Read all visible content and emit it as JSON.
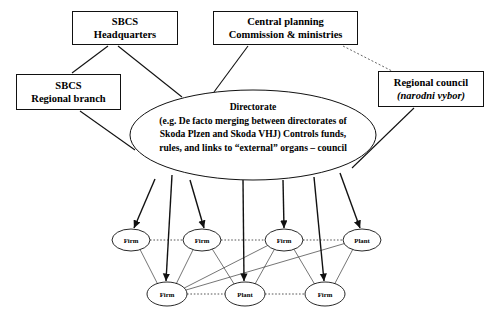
{
  "diagram": {
    "background_color": "#ffffff",
    "line_color": "#111111",
    "boxes": [
      {
        "id": "sbcs-headquarters",
        "lines": [
          "SBCS",
          "Headquarters"
        ],
        "x": 72,
        "y": 11,
        "w": 106,
        "h": 34
      },
      {
        "id": "central-planning",
        "lines": [
          "Central planning",
          "Commission & ministries"
        ],
        "x": 213,
        "y": 11,
        "w": 145,
        "h": 34
      },
      {
        "id": "sbcs-regional-branch",
        "lines": [
          "SBCS",
          "Regional branch"
        ],
        "x": 16,
        "y": 74,
        "w": 105,
        "h": 36
      },
      {
        "id": "regional-council",
        "lines": [
          "Regional council",
          "(narodni vybor)"
        ],
        "italic_lines": [
          1
        ],
        "x": 378,
        "y": 71,
        "w": 106,
        "h": 36
      }
    ],
    "directorate": {
      "id": "directorate",
      "title": "Directorate",
      "lines": [
        "(e.g. De facto merging between directorates of",
        "Skoda Plzen and Skoda VHJ) Controls funds,",
        "rules, and links to “external” organs – council"
      ],
      "cx": 253,
      "cy": 135,
      "rx": 123,
      "ry": 45
    },
    "leaf_nodes": [
      {
        "id": "firm-1",
        "label": "Firm",
        "cx": 131,
        "cy": 240,
        "rx": 19,
        "ry": 11
      },
      {
        "id": "firm-2",
        "label": "Firm",
        "cx": 202,
        "cy": 240,
        "rx": 19,
        "ry": 11
      },
      {
        "id": "firm-3",
        "label": "Firm",
        "cx": 284,
        "cy": 240,
        "rx": 19,
        "ry": 11
      },
      {
        "id": "plant-1",
        "label": "Plant",
        "cx": 362,
        "cy": 240,
        "rx": 19,
        "ry": 11
      },
      {
        "id": "firm-4",
        "label": "Firm",
        "cx": 167,
        "cy": 294,
        "rx": 20,
        "ry": 12
      },
      {
        "id": "plant-2",
        "label": "Plant",
        "cx": 245,
        "cy": 294,
        "rx": 20,
        "ry": 12
      },
      {
        "id": "firm-5",
        "label": "Firm",
        "cx": 325,
        "cy": 294,
        "rx": 20,
        "ry": 12
      }
    ],
    "solid_links": [
      {
        "id": "hq-to-ellipse",
        "x1": 118,
        "y1": 46,
        "x2": 182,
        "y2": 97
      },
      {
        "id": "hq-to-directorate-left",
        "x1": 108,
        "y1": 46,
        "x2": 72,
        "y2": 73
      },
      {
        "id": "cpc-to-ellipse",
        "x1": 248,
        "y1": 46,
        "x2": 214,
        "y2": 92
      },
      {
        "id": "regional-branch-to-ellipse",
        "x1": 80,
        "y1": 111,
        "x2": 135,
        "y2": 150
      },
      {
        "id": "regional-council-to-ellipse",
        "x1": 414,
        "y1": 108,
        "x2": 352,
        "y2": 168
      }
    ],
    "dotted_links": [
      {
        "id": "cpc-to-regional-council",
        "x1": 343,
        "y1": 46,
        "x2": 392,
        "y2": 71
      }
    ],
    "arrows": [
      {
        "id": "arrow-to-firm-1",
        "x1": 155,
        "y1": 179,
        "x2": 134,
        "y2": 228
      },
      {
        "id": "arrow-to-firm-4",
        "x1": 172,
        "y1": 175,
        "x2": 166,
        "y2": 281
      },
      {
        "id": "arrow-to-firm-2",
        "x1": 190,
        "y1": 180,
        "x2": 204,
        "y2": 228
      },
      {
        "id": "arrow-to-plant-2",
        "x1": 243,
        "y1": 180,
        "x2": 244,
        "y2": 281
      },
      {
        "id": "arrow-to-firm-3",
        "x1": 283,
        "y1": 180,
        "x2": 284,
        "y2": 228
      },
      {
        "id": "arrow-to-firm-5",
        "x1": 314,
        "y1": 177,
        "x2": 324,
        "y2": 281
      },
      {
        "id": "arrow-to-plant-1",
        "x1": 340,
        "y1": 173,
        "x2": 360,
        "y2": 228
      }
    ],
    "dotted_chains": [
      {
        "id": "top-row-chain",
        "nodes": [
          "firm-1",
          "firm-2",
          "firm-3",
          "plant-1"
        ]
      },
      {
        "id": "bottom-row-chain",
        "nodes": [
          "firm-4",
          "plant-2",
          "firm-5"
        ]
      }
    ],
    "thin_cross_links": [
      {
        "id": "firm-1-to-firm-4",
        "from": "firm-1",
        "to": "firm-4"
      },
      {
        "id": "firm-2-to-firm-4",
        "from": "firm-2",
        "to": "firm-4"
      },
      {
        "id": "firm-2-to-plant-2",
        "from": "firm-2",
        "to": "plant-2"
      },
      {
        "id": "firm-3-to-plant-2",
        "from": "firm-3",
        "to": "plant-2"
      },
      {
        "id": "firm-3-to-firm-5",
        "from": "firm-3",
        "to": "firm-5"
      },
      {
        "id": "firm-3-to-firm-4",
        "from": "firm-3",
        "to": "firm-4"
      },
      {
        "id": "plant-1-to-firm-5",
        "from": "plant-1",
        "to": "firm-5"
      },
      {
        "id": "plant-1-to-firm-4",
        "from": "plant-1",
        "to": "firm-4"
      }
    ]
  }
}
